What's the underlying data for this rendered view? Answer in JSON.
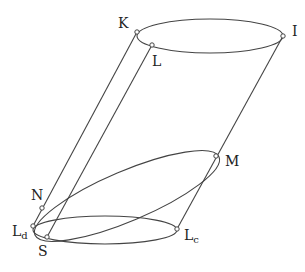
{
  "diagram": {
    "type": "oblique cylinder with inscribed tilted ellipse",
    "points": {
      "K": {
        "label": "K",
        "x": 137,
        "y": 32
      },
      "L": {
        "label": "L",
        "x": 152,
        "y": 45
      },
      "I": {
        "label": "I",
        "x": 283,
        "y": 36
      },
      "M": {
        "label": "M",
        "x": 216,
        "y": 156
      },
      "N": {
        "label": "N",
        "x": 42,
        "y": 208
      },
      "Ld": {
        "label": "L",
        "sub": "d",
        "x": 33,
        "y": 226
      },
      "S": {
        "label": "S",
        "x": 47,
        "y": 237
      },
      "Lc": {
        "label": "L",
        "sub": "c",
        "x": 177,
        "y": 229
      }
    },
    "top_ellipse": {
      "cx": 210,
      "cy": 36,
      "rx": 73,
      "ry": 17
    },
    "bottom_ellipse": {
      "cx": 105,
      "cy": 230,
      "rx": 72,
      "ry": 14
    },
    "tilted_ellipse": {
      "cx": 127,
      "cy": 195,
      "rx": 100,
      "ry": 26,
      "rotate": -24
    },
    "generators": [
      {
        "from": "K",
        "to": "Ld"
      },
      {
        "from": "L",
        "to": "S"
      },
      {
        "from": "I",
        "to": "Lc"
      }
    ],
    "stroke_color": "#444444"
  }
}
